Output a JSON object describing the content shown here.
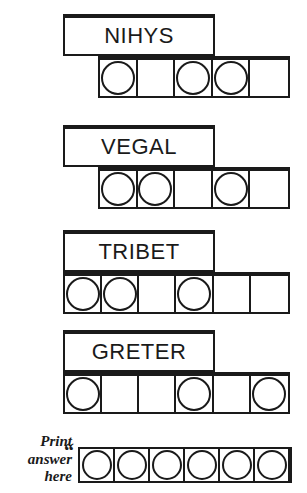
{
  "worksheet": {
    "rows": [
      {
        "word": "NIHYS",
        "box": {
          "left": 63,
          "top": 14,
          "width": 152,
          "height": 42
        },
        "strip": {
          "left": 98,
          "top": 56,
          "width": 192,
          "height": 42,
          "cells": 5
        },
        "circles": [
          true,
          false,
          true,
          true,
          false
        ]
      },
      {
        "word": "VEGAL",
        "box": {
          "left": 63,
          "top": 125,
          "width": 152,
          "height": 42
        },
        "strip": {
          "left": 98,
          "top": 167,
          "width": 192,
          "height": 42,
          "cells": 5
        },
        "circles": [
          true,
          true,
          false,
          true,
          false
        ]
      },
      {
        "word": "TRIBET",
        "box": {
          "left": 63,
          "top": 230,
          "width": 152,
          "height": 42
        },
        "strip": {
          "left": 63,
          "top": 272,
          "width": 227,
          "height": 42,
          "cells": 6
        },
        "circles": [
          true,
          true,
          false,
          true,
          false,
          false
        ]
      },
      {
        "word": "GRETER",
        "box": {
          "left": 63,
          "top": 330,
          "width": 152,
          "height": 42
        },
        "strip": {
          "left": 63,
          "top": 372,
          "width": 227,
          "height": 42,
          "cells": 6
        },
        "circles": [
          true,
          false,
          false,
          true,
          false,
          true
        ]
      }
    ],
    "answer": {
      "label_line1": "Print",
      "label_line2": "answer",
      "label_line3": "here",
      "label_pos": {
        "top": 433
      },
      "quote": "“",
      "quote_pos": {
        "left": 64,
        "top": 441
      },
      "strip": {
        "left": 78,
        "top": 447,
        "width": 214,
        "height": 36,
        "cells": 6
      },
      "circles": [
        true,
        true,
        true,
        true,
        true,
        true
      ]
    },
    "colors": {
      "ink": "#1a1a1a",
      "paper": "#ffffff"
    }
  }
}
